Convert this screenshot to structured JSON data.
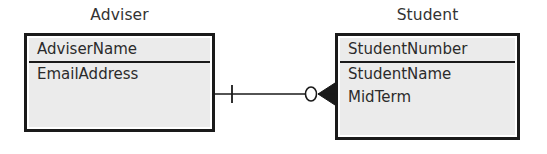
{
  "diagram": {
    "type": "entity-relationship-diagram",
    "notation": "crows-foot",
    "background_color": "#ffffff",
    "entity_fill_color": "#ebebeb",
    "line_color": "#1a1a1a"
  },
  "entities": [
    {
      "id": "adviser",
      "title": "Adviser",
      "key_attributes": [
        "AdviserName"
      ],
      "attributes": [
        "EmailAddress"
      ]
    },
    {
      "id": "student",
      "title": "Student",
      "key_attributes": [
        "StudentNumber"
      ],
      "attributes": [
        "StudentName",
        "MidTerm"
      ]
    }
  ],
  "relationship": {
    "from_entity": "Adviser",
    "to_entity": "Student",
    "from_cardinality": "one",
    "to_cardinality": "zero-or-many",
    "from_symbol": "one-tick",
    "to_symbol": "optional-many-crows-foot"
  },
  "labels": {
    "adviser_title": "Adviser",
    "student_title": "Student",
    "adviser_key_1": "AdviserName",
    "adviser_attr_1": "EmailAddress",
    "student_key_1": "StudentNumber",
    "student_attr_1": "StudentName",
    "student_attr_2": "MidTerm"
  }
}
